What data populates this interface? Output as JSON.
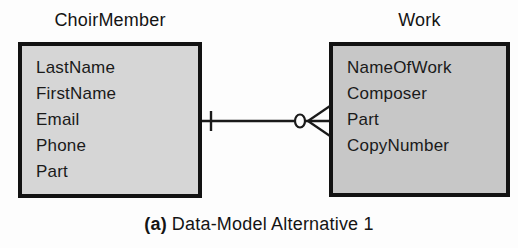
{
  "diagram": {
    "entities": [
      {
        "name": "ChoirMember",
        "attributes": [
          "LastName",
          "FirstName",
          "Email",
          "Phone",
          "Part"
        ],
        "fill": "#d6d6d6"
      },
      {
        "name": "Work",
        "attributes": [
          "NameOfWork",
          "Composer",
          "Part",
          "CopyNumber"
        ],
        "fill": "#c7c7c7"
      }
    ],
    "relationship": {
      "from": "ChoirMember",
      "to": "Work",
      "from_cardinality": "one",
      "to_cardinality": "zero-or-many",
      "notation": "crows-foot"
    }
  },
  "caption": {
    "label": "(a)",
    "text": "Data-Model Alternative 1"
  },
  "colors": {
    "background": "#fdfdfd",
    "box_border": "#121212",
    "line": "#1a1a1a",
    "left_entity_fill": "#d6d6d6",
    "right_entity_fill": "#c7c7c7"
  }
}
